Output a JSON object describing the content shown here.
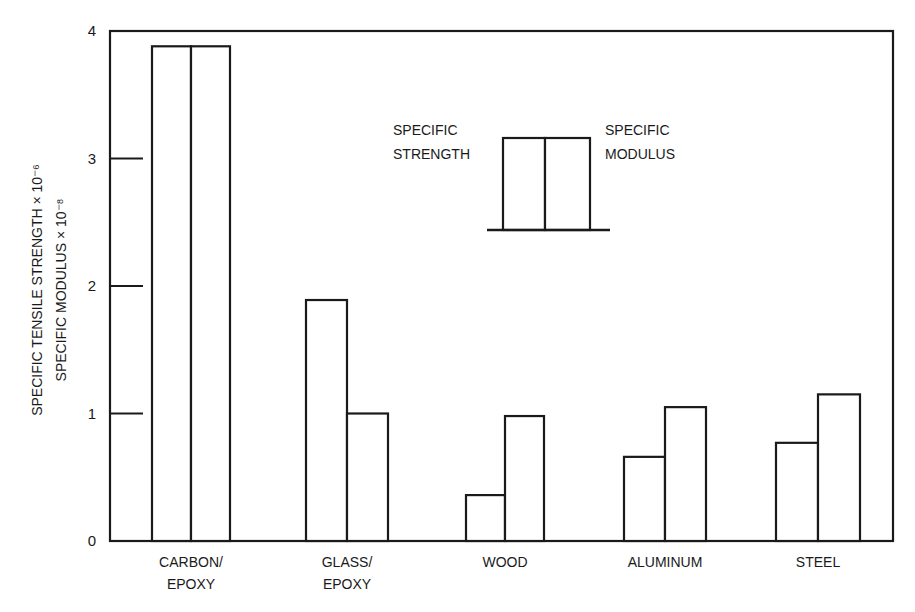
{
  "chart_data": {
    "type": "bar",
    "title": "",
    "xlabel": "",
    "ylabel_lines": [
      "SPECIFIC TENSILE STRENGTH × 10⁻⁶",
      "SPECIFIC MODULUS × 10⁻⁸"
    ],
    "categories": [
      [
        "CARBON/",
        "EPOXY"
      ],
      [
        "GLASS/",
        "EPOXY"
      ],
      [
        "WOOD"
      ],
      [
        "ALUMINUM"
      ],
      [
        "STEEL"
      ]
    ],
    "category_names": [
      "CARBON/EPOXY",
      "GLASS/EPOXY",
      "WOOD",
      "ALUMINUM",
      "STEEL"
    ],
    "series": [
      {
        "name": "SPECIFIC STRENGTH",
        "values": [
          3.88,
          1.89,
          0.36,
          0.66,
          0.77
        ]
      },
      {
        "name": "SPECIFIC MODULUS",
        "values": [
          3.88,
          1.0,
          0.98,
          1.05,
          1.15
        ]
      }
    ],
    "ylim": [
      0,
      4
    ],
    "yticks": [
      0,
      1,
      2,
      3,
      4
    ],
    "grid": false,
    "legend": {
      "position": "upper-center",
      "left_label": [
        "SPECIFIC",
        "STRENGTH"
      ],
      "right_label": [
        "SPECIFIC",
        "MODULUS"
      ]
    },
    "colors": {
      "line": "#1a1a1a",
      "bar_fill": "#ffffff",
      "background": "#ffffff"
    }
  }
}
